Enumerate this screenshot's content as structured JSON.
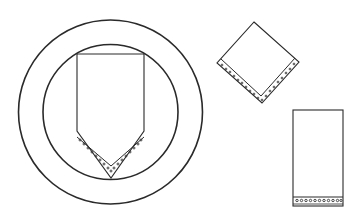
{
  "diagram": {
    "title": "",
    "colors": {
      "stroke": "#2a2a2a",
      "background": "#ffffff"
    },
    "elements": [
      {
        "id": "plate",
        "shape": "double-circle",
        "label": ""
      },
      {
        "id": "napkin-pointed",
        "shape": "pentagon-point-down",
        "label": ""
      },
      {
        "id": "napkin-diamond",
        "shape": "diamond",
        "label": ""
      },
      {
        "id": "napkin-rectangle",
        "shape": "rectangle",
        "label": ""
      }
    ]
  }
}
